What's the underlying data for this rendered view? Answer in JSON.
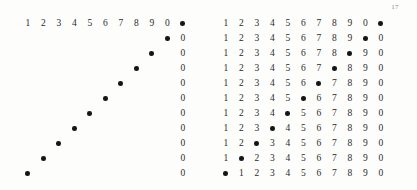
{
  "page": {
    "folio": "17",
    "paper_color": "#fdfdfc",
    "ink_color": "#2b2b2b",
    "dot_color": "#161616",
    "folio_color": "#8e8e8e"
  },
  "figures": [
    {
      "id": "figure-left",
      "name": "sparse-diagonal-grid",
      "rows": 11,
      "columns": 11,
      "description": "Only the first row of digits, the descending diagonal of dots, and the trailing zero column are inked.",
      "cells": [
        [
          "1",
          "2",
          "3",
          "4",
          "5",
          "6",
          "7",
          "8",
          "9",
          "0",
          "●"
        ],
        [
          "",
          "",
          "",
          "",
          "",
          "",
          "",
          "",
          "",
          "●",
          "0"
        ],
        [
          "",
          "",
          "",
          "",
          "",
          "",
          "",
          "",
          "●",
          "",
          "0"
        ],
        [
          "",
          "",
          "",
          "",
          "",
          "",
          "",
          "●",
          "",
          "",
          "0"
        ],
        [
          "",
          "",
          "",
          "",
          "",
          "",
          "●",
          "",
          "",
          "",
          "0"
        ],
        [
          "",
          "",
          "",
          "",
          "",
          "●",
          "",
          "",
          "",
          "",
          "0"
        ],
        [
          "",
          "",
          "",
          "",
          "●",
          "",
          "",
          "",
          "",
          "",
          "0"
        ],
        [
          "",
          "",
          "",
          "●",
          "",
          "",
          "",
          "",
          "",
          "",
          "0"
        ],
        [
          "",
          "",
          "●",
          "",
          "",
          "",
          "",
          "",
          "",
          "",
          "0"
        ],
        [
          "",
          "●",
          "",
          "",
          "",
          "",
          "",
          "",
          "",
          "",
          "0"
        ],
        [
          "●",
          "",
          "",
          "",
          "",
          "",
          "",
          "",
          "",
          "",
          "0"
        ]
      ]
    },
    {
      "id": "figure-right",
      "name": "full-digit-grid",
      "rows": 11,
      "columns": 11,
      "description": "Every cell inked; the dot advances one column left per row while digits 1 through 0 flow around it.",
      "cells": [
        [
          "1",
          "2",
          "3",
          "4",
          "5",
          "6",
          "7",
          "8",
          "9",
          "0",
          "●"
        ],
        [
          "1",
          "2",
          "3",
          "4",
          "5",
          "6",
          "7",
          "8",
          "9",
          "●",
          "0"
        ],
        [
          "1",
          "2",
          "3",
          "4",
          "5",
          "6",
          "7",
          "8",
          "●",
          "9",
          "0"
        ],
        [
          "1",
          "2",
          "3",
          "4",
          "5",
          "6",
          "7",
          "●",
          "8",
          "9",
          "0"
        ],
        [
          "1",
          "2",
          "3",
          "4",
          "5",
          "6",
          "●",
          "7",
          "8",
          "9",
          "0"
        ],
        [
          "1",
          "2",
          "3",
          "4",
          "5",
          "●",
          "6",
          "7",
          "8",
          "9",
          "0"
        ],
        [
          "1",
          "2",
          "3",
          "4",
          "●",
          "5",
          "6",
          "7",
          "8",
          "9",
          "0"
        ],
        [
          "1",
          "2",
          "3",
          "●",
          "4",
          "5",
          "6",
          "7",
          "8",
          "9",
          "0"
        ],
        [
          "1",
          "2",
          "●",
          "3",
          "4",
          "5",
          "6",
          "7",
          "8",
          "9",
          "0"
        ],
        [
          "1",
          "●",
          "2",
          "3",
          "4",
          "5",
          "6",
          "7",
          "8",
          "9",
          "0"
        ],
        [
          "●",
          "1",
          "2",
          "3",
          "4",
          "5",
          "6",
          "7",
          "8",
          "9",
          "0"
        ]
      ]
    }
  ]
}
